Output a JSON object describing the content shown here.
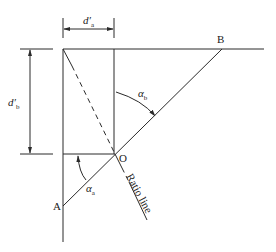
{
  "diagram": {
    "points": {
      "A": "A",
      "B": "B",
      "O": "O"
    },
    "dimensions": {
      "da": {
        "base": "d",
        "prime": "′",
        "sub": "a"
      },
      "db": {
        "base": "d",
        "prime": "′",
        "sub": "b"
      }
    },
    "angles": {
      "alpha_a": {
        "base": "α",
        "sub": "a"
      },
      "alpha_b": {
        "base": "α",
        "sub": "b"
      }
    },
    "ratio_line_label": "Ratio line"
  }
}
